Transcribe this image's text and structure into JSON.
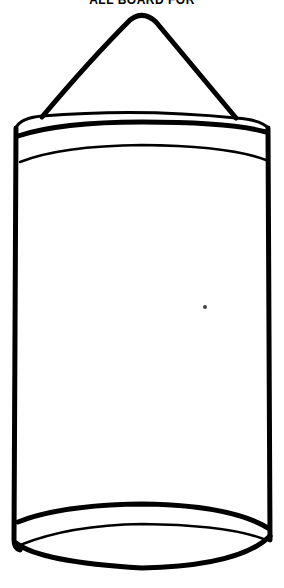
{
  "caption": {
    "text": "ALL BOARD FOR"
  },
  "drawing": {
    "subject": "hanging-cylinder-punching-bag",
    "stroke_color": "#000000",
    "background_color": "#ffffff"
  }
}
